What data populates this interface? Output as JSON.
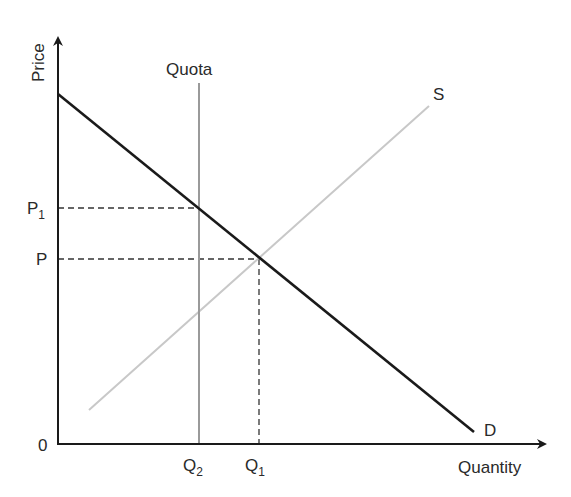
{
  "diagram": {
    "axes": {
      "y_label": "Price",
      "x_label": "Quantity",
      "origin_label": "0"
    },
    "curves": {
      "demand": {
        "label": "D"
      },
      "supply": {
        "label": "S"
      },
      "quota": {
        "label": "Quota"
      }
    },
    "price_levels": [
      {
        "id": "p1",
        "label": "P",
        "subscript": "1"
      },
      {
        "id": "p",
        "label": "P",
        "subscript": ""
      }
    ],
    "quantity_levels": [
      {
        "id": "q2",
        "label": "Q",
        "subscript": "2"
      },
      {
        "id": "q1",
        "label": "Q",
        "subscript": "1"
      }
    ],
    "colors": {
      "axis": "#1a1a1a",
      "demand": "#1a1a1a",
      "supply": "#c8c8c8",
      "quota": "#9a9a9a",
      "guide": "#333333",
      "text": "#2a2a2a"
    }
  }
}
